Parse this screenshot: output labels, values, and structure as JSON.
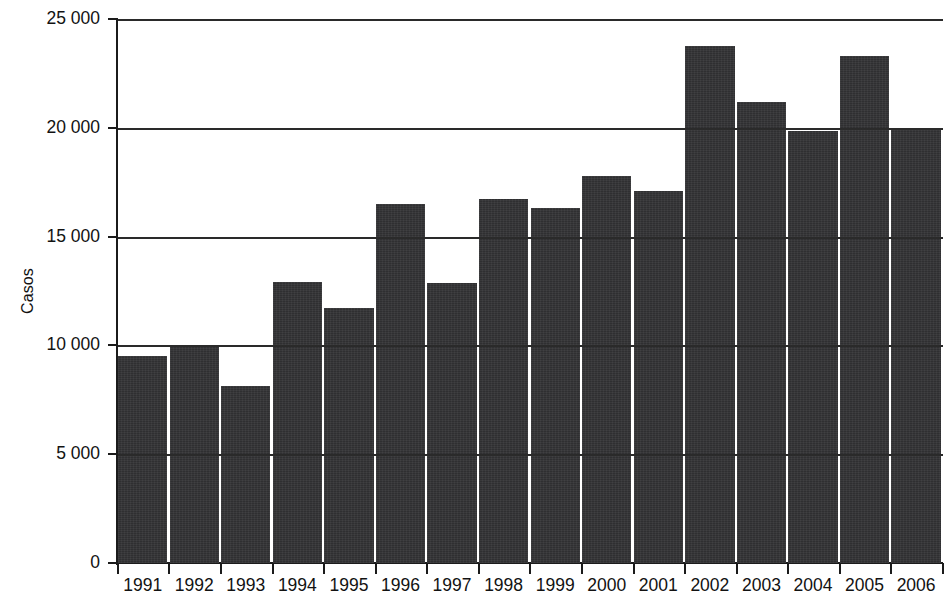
{
  "chart_data": {
    "type": "bar",
    "title": "",
    "subtitle": "",
    "xlabel": "",
    "ylabel": "Casos",
    "categories": [
      "1991",
      "1992",
      "1993",
      "1994",
      "1995",
      "1996",
      "1997",
      "1998",
      "1999",
      "2000",
      "2001",
      "2002",
      "2003",
      "2004",
      "2005",
      "2006"
    ],
    "values": [
      9500,
      9950,
      8150,
      12900,
      11700,
      16500,
      12850,
      16750,
      16300,
      17800,
      17100,
      23750,
      21200,
      19850,
      23300,
      19950
    ],
    "ylim": [
      0,
      25000
    ],
    "ytick_values": [
      0,
      5000,
      10000,
      15000,
      20000,
      25000
    ],
    "ytick_labels": [
      "0",
      "5 000",
      "10 000",
      "15 000",
      "20 000",
      "25 000"
    ],
    "grid": "horizontal",
    "legend": "none",
    "bar_color": "#333335",
    "axis_color": "#1b1b1b",
    "background_color": "#ffffff",
    "note": "Last bar (2006) is clipped by the right edge of the image"
  },
  "axes": {
    "y_title": "Casos"
  }
}
